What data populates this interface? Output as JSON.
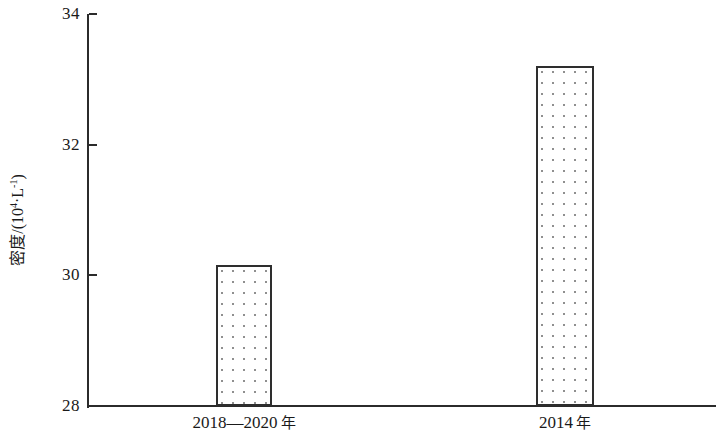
{
  "chart_data": {
    "type": "bar",
    "title": "",
    "subtitle": "",
    "xlabel": "",
    "ylabel": "密度/(10⁴·L⁻¹)",
    "ylabel_parts": {
      "prefix": "密度/(10",
      "exponent": "4",
      "middle": "·L",
      "exponent2": "-1",
      "suffix": ")"
    },
    "categories": [
      "2018—2020 年",
      "2014 年"
    ],
    "category_parts": [
      {
        "number": "2018—2020",
        "unit": "年"
      },
      {
        "number": "2014",
        "unit": "年"
      }
    ],
    "values": [
      30.17,
      33.24
    ],
    "ylim": [
      28,
      34
    ],
    "yticks": [
      28,
      30,
      32,
      34
    ],
    "ytick_labels": [
      "28",
      "30",
      "32",
      "34"
    ],
    "grid": false,
    "legend": null,
    "bar_style": {
      "fill": "dotted-stipple",
      "fill_color": "#ffffff",
      "dot_color": "#8f8f8f",
      "border_color": "#2e2e2e",
      "axis_color": "#2b2b2b",
      "background": "#ffffff"
    },
    "geometry": {
      "plot_left": 87,
      "plot_right": 716,
      "plot_top": 14,
      "plot_bottom": 406,
      "bars": [
        {
          "x": 216,
          "width": 56,
          "top": 265
        },
        {
          "x": 536,
          "width": 58,
          "top": 66
        }
      ]
    }
  }
}
